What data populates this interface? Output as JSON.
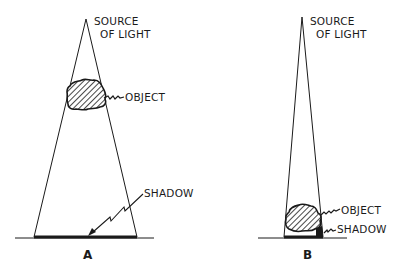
{
  "diagram": {
    "panel_a": {
      "caption": "A",
      "source_label_line1": "SOURCE",
      "source_label_line2": "OF  LIGHT",
      "object_label": "OBJECT",
      "shadow_label": "SHADOW"
    },
    "panel_b": {
      "caption": "B",
      "source_label_line1": "SOURCE",
      "source_label_line2": "OF  LIGHT",
      "object_label": "OBJECT",
      "shadow_label": "SHADOW"
    },
    "colors": {
      "line": "#1a1a1a",
      "background": "#ffffff"
    }
  }
}
